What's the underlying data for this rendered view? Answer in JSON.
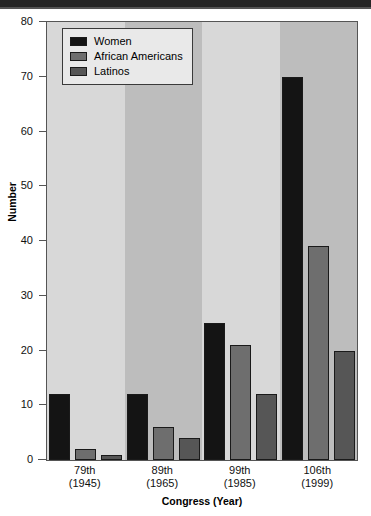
{
  "chart_data": {
    "type": "bar",
    "title": "",
    "xlabel": "Congress (Year)",
    "ylabel": "Number",
    "ylim": [
      0,
      80
    ],
    "yticks": [
      0,
      10,
      20,
      30,
      40,
      50,
      60,
      70,
      80
    ],
    "grid": false,
    "legend_position": "top-left",
    "categories": [
      "79th\n(1945)",
      "89th\n(1965)",
      "99th\n(1985)",
      "106th\n(1999)"
    ],
    "category_lines": [
      {
        "line1": "79th",
        "line2": "(1945)"
      },
      {
        "line1": "89th",
        "line2": "(1965)"
      },
      {
        "line1": "99th",
        "line2": "(1985)"
      },
      {
        "line1": "106th",
        "line2": "(1999)"
      }
    ],
    "series": [
      {
        "name": "Women",
        "color": "#141414",
        "values": [
          12,
          12,
          25,
          70
        ]
      },
      {
        "name": "African Americans",
        "color": "#6e6e6e",
        "values": [
          2,
          6,
          21,
          39
        ]
      },
      {
        "name": "Latinos",
        "color": "#565656",
        "values": [
          1,
          4,
          12,
          20
        ]
      }
    ],
    "background_bands": [
      "#d8d8d8",
      "#bdbdbd",
      "#d8d8d8",
      "#bdbdbd"
    ]
  },
  "legend": {
    "items": [
      {
        "label": "Women",
        "color": "#141414"
      },
      {
        "label": "African Americans",
        "color": "#6e6e6e"
      },
      {
        "label": "Latinos",
        "color": "#565656"
      }
    ]
  },
  "axis": {
    "y_title": "Number",
    "x_title": "Congress (Year)",
    "y_tick_labels": [
      "0",
      "10",
      "20",
      "30",
      "40",
      "50",
      "60",
      "70",
      "80"
    ]
  }
}
